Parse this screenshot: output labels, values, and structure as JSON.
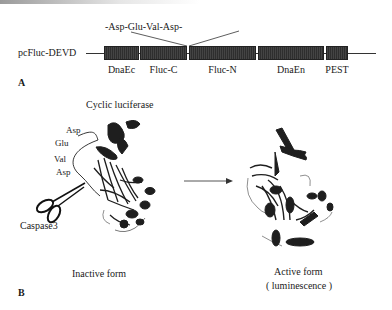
{
  "panel_a": {
    "panel_label": "A",
    "construct_name": "pcFluc-DEVD",
    "linker_sequence": "-Asp-Glu-Val-Asp-",
    "segments": [
      {
        "label": "DnaEc"
      },
      {
        "label": "Fluc-C"
      },
      {
        "label": "Fluc-N"
      },
      {
        "label": "DnaEn"
      },
      {
        "label": "PEST"
      }
    ]
  },
  "panel_b": {
    "panel_label": "B",
    "title": "Cyclic luciferase",
    "loop_residues": [
      "Asp",
      "Glu",
      "Val",
      "Asp"
    ],
    "protease_label": "Caspase3",
    "inactive_label": "Inactive form",
    "active_label_line1": "Active form",
    "active_label_line2": "( luminescence )"
  },
  "colors": {
    "segment_fill": "#3a3a3a",
    "line": "#333333",
    "protein": "#1e1e1e"
  }
}
